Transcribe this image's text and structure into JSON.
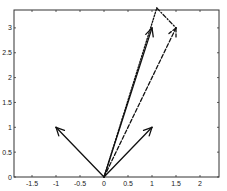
{
  "chart_data": {
    "type": "line",
    "title": "",
    "xlabel": "",
    "ylabel": "",
    "xlim": [
      -1.9,
      2.4
    ],
    "ylim": [
      0,
      3.35
    ],
    "grid": false,
    "x_ticks": [
      -1.5,
      -1,
      -0.5,
      0,
      0.5,
      1,
      1.5,
      2
    ],
    "x_tick_labels": [
      "-1.5",
      "-1",
      "-0.5",
      "0",
      "0.5",
      "1",
      "1.5",
      "2"
    ],
    "y_ticks": [
      0,
      0.5,
      1,
      1.5,
      2,
      2.5,
      3
    ],
    "y_tick_labels": [
      "0",
      "0.5",
      "1",
      "1.5",
      "2",
      "2.5",
      "3"
    ],
    "series": [
      {
        "name": "vector a",
        "style": "solid",
        "arrow": true,
        "x": [
          0,
          -1
        ],
        "y": [
          0,
          1
        ]
      },
      {
        "name": "vector b",
        "style": "solid",
        "arrow": true,
        "x": [
          0,
          1
        ],
        "y": [
          0,
          1
        ]
      },
      {
        "name": "vector c",
        "style": "solid",
        "arrow": true,
        "x": [
          0,
          1
        ],
        "y": [
          0,
          3
        ]
      },
      {
        "name": "dashed vector",
        "style": "dashed",
        "arrow": true,
        "x": [
          0,
          1.5
        ],
        "y": [
          0,
          3
        ]
      },
      {
        "name": "dotted line",
        "style": "dotted",
        "arrow": false,
        "x": [
          0,
          1.1
        ],
        "y": [
          0,
          3.4
        ]
      },
      {
        "name": "dash-dot line",
        "style": "dashdot",
        "arrow": false,
        "x": [
          1.1,
          1.5
        ],
        "y": [
          3.4,
          3
        ]
      }
    ]
  }
}
